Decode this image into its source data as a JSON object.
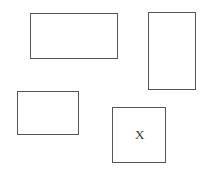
{
  "diagram": {
    "shapes": [
      {
        "id": "rect-top-left",
        "type": "rectangle",
        "x": 30,
        "y": 13,
        "w": 88,
        "h": 46,
        "label": ""
      },
      {
        "id": "rect-top-right",
        "type": "rectangle",
        "x": 148,
        "y": 12,
        "w": 48,
        "h": 78,
        "label": ""
      },
      {
        "id": "rect-bottom-left",
        "type": "rectangle",
        "x": 17,
        "y": 91,
        "w": 62,
        "h": 44,
        "label": ""
      },
      {
        "id": "rect-bottom-right",
        "type": "rectangle",
        "x": 112,
        "y": 107,
        "w": 54,
        "h": 56,
        "label": "X"
      }
    ],
    "stroke_color": "#555555",
    "background": "#ffffff"
  }
}
